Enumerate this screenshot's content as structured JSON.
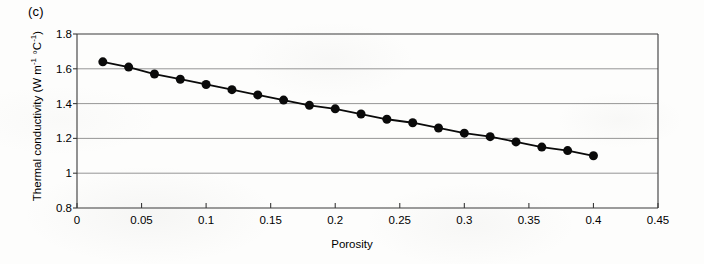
{
  "panel": {
    "label": "(c)"
  },
  "chart_data": {
    "type": "line",
    "title": "",
    "panel_label": "(c)",
    "xlabel": "Porosity",
    "ylabel": "Thermal conductivity (W m⁻¹ °C⁻¹)",
    "ylabel_parts": {
      "main": "Thermal conductivity (W m",
      "sup1": "-1",
      "mid": " °C",
      "sup2": "-1",
      "tail": ")"
    },
    "xlim": [
      0,
      0.45
    ],
    "ylim": [
      0.8,
      1.8
    ],
    "xticks": [
      0,
      0.05,
      0.1,
      0.15,
      0.2,
      0.25,
      0.3,
      0.35,
      0.4,
      0.45
    ],
    "xticklabels": [
      "0",
      "0.05",
      "0.1",
      "0.15",
      "0.2",
      "0.25",
      "0.3",
      "0.35",
      "0.4",
      "0.45"
    ],
    "yticks": [
      0.8,
      1.0,
      1.2,
      1.4,
      1.6,
      1.8
    ],
    "yticklabels": [
      "0.8",
      "1",
      "1.2",
      "1.4",
      "1.6",
      "1.8"
    ],
    "grid": "horizontal",
    "gridcolor": "#8a8a8a",
    "legend": null,
    "marker": "filled-circle",
    "markercolor": "#0a0a0a",
    "markersize": 9,
    "linecolor": "#0a0a0a",
    "linewidth": 1.8,
    "x": [
      0.02,
      0.04,
      0.06,
      0.08,
      0.1,
      0.12,
      0.14,
      0.16,
      0.18,
      0.2,
      0.22,
      0.24,
      0.26,
      0.28,
      0.3,
      0.32,
      0.34,
      0.36,
      0.38,
      0.4
    ],
    "values": [
      1.64,
      1.61,
      1.57,
      1.54,
      1.51,
      1.48,
      1.45,
      1.42,
      1.39,
      1.37,
      1.34,
      1.31,
      1.29,
      1.26,
      1.23,
      1.21,
      1.18,
      1.15,
      1.13,
      1.1
    ],
    "series": [
      {
        "name": "Thermal conductivity",
        "values": [
          1.64,
          1.61,
          1.57,
          1.54,
          1.51,
          1.48,
          1.45,
          1.42,
          1.39,
          1.37,
          1.34,
          1.31,
          1.29,
          1.26,
          1.23,
          1.21,
          1.18,
          1.15,
          1.13,
          1.1
        ]
      }
    ]
  }
}
